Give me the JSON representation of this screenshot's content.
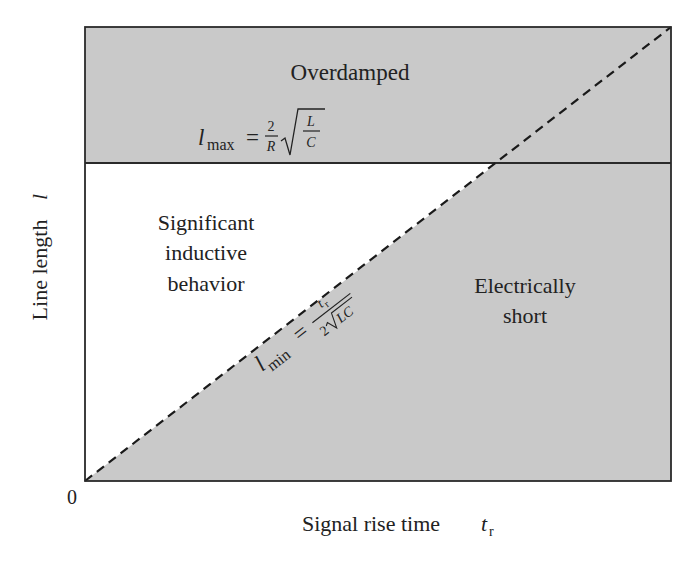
{
  "diagram": {
    "title": "",
    "axes": {
      "x_label": "Signal rise time",
      "x_label_var": "t",
      "x_label_sub": "r",
      "y_label": "Line length",
      "y_label_var": "l",
      "origin_label": "0"
    },
    "regions": {
      "overdamped": {
        "label": "Overdamped"
      },
      "inductive": {
        "lines": [
          "Significant",
          "inductive",
          "behavior"
        ]
      },
      "short": {
        "lines": [
          "Electrically",
          "short"
        ]
      }
    },
    "boundaries": {
      "l_max": {
        "lhs_var": "l",
        "lhs_sub": "max",
        "equals": "=",
        "frac_num": "2",
        "frac_den": "R",
        "sqrt_num": "L",
        "sqrt_den": "C",
        "style": "solid"
      },
      "l_min": {
        "lhs_var": "l",
        "lhs_sub": "min",
        "equals": "=",
        "frac_num_var": "t",
        "frac_num_sub": "r",
        "frac_den_coef": "2",
        "frac_den_sqrt": "LC",
        "style": "dashed"
      }
    },
    "colors": {
      "shaded_fill": "#c9c9c9",
      "unshaded_fill": "#ffffff",
      "line": "#2a2a2a",
      "text": "#222222"
    }
  }
}
